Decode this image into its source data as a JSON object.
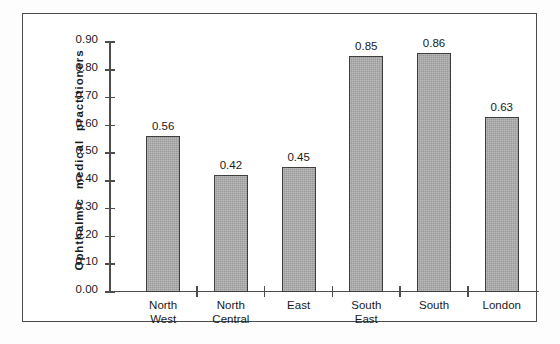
{
  "chart_data": {
    "type": "bar",
    "title": "",
    "xlabel": "",
    "ylabel": "Ophthalmic  medical  practitioners",
    "categories": [
      "North\nWest",
      "North\nCentral",
      "East",
      "South\nEast",
      "South",
      "London"
    ],
    "category_plain": [
      "North West",
      "North Central",
      "East",
      "South East",
      "South",
      "London"
    ],
    "values": [
      0.56,
      0.42,
      0.45,
      0.85,
      0.86,
      0.63
    ],
    "value_labels": [
      "0.56",
      "0.42",
      "0.45",
      "0.85",
      "0.86",
      "0.63"
    ],
    "ylim": [
      0.0,
      0.9
    ],
    "ytick_values": [
      0.9,
      0.8,
      0.7,
      0.6,
      0.5,
      0.4,
      0.3,
      0.2,
      0.1,
      0.0
    ],
    "ytick_labels": [
      "0.90",
      "0.80",
      "0.70",
      "0.60",
      "0.50",
      "0.40",
      "0.30",
      "0.20",
      "0.10",
      "0.00"
    ],
    "grid": false,
    "legend": null,
    "bar_color": "#9b9b9b",
    "bar_edge_color": "#3f3f3f",
    "axis_color": "#4d4d4d",
    "text_color": "#1a1a1a",
    "background": "#ffffff"
  }
}
